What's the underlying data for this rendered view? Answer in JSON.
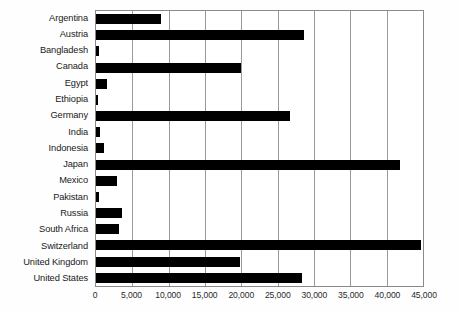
{
  "chart_data": {
    "type": "bar",
    "orientation": "horizontal",
    "title": "",
    "subtitle": "",
    "xlabel": "",
    "ylabel": "",
    "xlim": [
      0,
      45000
    ],
    "ylim": null,
    "grid": true,
    "grid_axis": "x",
    "legend": false,
    "legend_position": "none",
    "bar_color": "#000000",
    "gridline_color": "#9a9a9a",
    "axis_color": "#8a8a8a",
    "background_color": "#ffffff",
    "categories": [
      "Argentina",
      "Austria",
      "Bangladesh",
      "Canada",
      "Egypt",
      "Ethiopia",
      "Germany",
      "India",
      "Indonesia",
      "Japan",
      "Mexico",
      "Pakistan",
      "Russia",
      "South Africa",
      "Switzerland",
      "United Kingdom",
      "United States"
    ],
    "values": [
      8900,
      28600,
      400,
      20000,
      1500,
      300,
      26700,
      600,
      1100,
      41800,
      2900,
      350,
      3600,
      3100,
      44700,
      19800,
      28400
    ],
    "xticks": [
      0,
      5000,
      10000,
      15000,
      20000,
      25000,
      30000,
      35000,
      40000,
      45000
    ],
    "xtick_labels": [
      "0",
      "5,000",
      "10,000",
      "15,000",
      "20,000",
      "25,000",
      "30,000",
      "35,000",
      "40,000",
      "45,000"
    ]
  }
}
